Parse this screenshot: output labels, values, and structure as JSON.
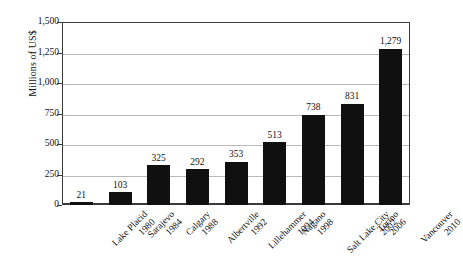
{
  "chart_data": {
    "type": "bar",
    "title": "",
    "subtitle": "",
    "xlabel": "",
    "ylabel": "Millions of US$",
    "ylim": [
      0,
      1500
    ],
    "yticks": [
      0,
      250,
      500,
      750,
      1000,
      1250,
      1500
    ],
    "ytick_labels": [
      "0",
      "250",
      "500",
      "750",
      "1,000",
      "1,250",
      "1,500"
    ],
    "grid": true,
    "legend": "none",
    "bar_color": "#101010",
    "categories": [
      "Lake Placid 1980",
      "Sarajevo 1984",
      "Calgary 1988",
      "Albertville 1992",
      "Lillehammer 1994",
      "Nagano 1998",
      "Salt Lake City 2002",
      "Torino 2006",
      "Vancouver 2010"
    ],
    "cities": [
      "Lake Placid",
      "Sarajevo",
      "Calgary",
      "Albertville",
      "Lillehammer",
      "Nagano",
      "Salt Lake City",
      "Torino",
      "Vancouver"
    ],
    "years": [
      "1980",
      "1984",
      "1988",
      "1992",
      "1994",
      "1998",
      "2002",
      "2006",
      "2010"
    ],
    "values": [
      21,
      103,
      325,
      292,
      353,
      513,
      738,
      831,
      1279
    ],
    "value_labels": [
      "21",
      "103",
      "325",
      "292",
      "353",
      "513",
      "738",
      "831",
      "1,279"
    ]
  }
}
